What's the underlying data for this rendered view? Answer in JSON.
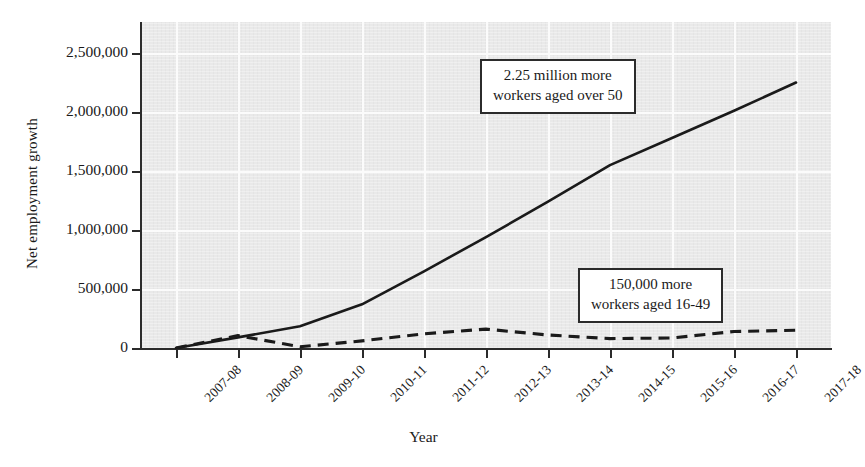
{
  "chart_data": {
    "type": "line",
    "title": "",
    "xlabel": "Year",
    "ylabel": "Net employment growth",
    "categories": [
      "2007-08",
      "2008-09",
      "2009-10",
      "2010-11",
      "2011-12",
      "2012-13",
      "2013-14",
      "2014-15",
      "2015-16",
      "2016-17",
      "2017-18"
    ],
    "ylim": [
      0,
      2500000
    ],
    "yticks": [
      0,
      500000,
      1000000,
      1500000,
      2000000,
      2500000
    ],
    "ytick_labels": [
      "0",
      "500,000",
      "1,000,000",
      "1,500,000",
      "2,000,000",
      "2,500,000"
    ],
    "grid": true,
    "legend_position": "none",
    "series": [
      {
        "name": "workers aged over 50",
        "style": "solid",
        "color": "#1a1a1a",
        "values": [
          0,
          90000,
          185000,
          370000,
          650000,
          940000,
          1240000,
          1550000,
          1780000,
          2010000,
          2250000
        ]
      },
      {
        "name": "workers aged 16-49",
        "style": "dashed",
        "color": "#1a1a1a",
        "values": [
          0,
          105000,
          10000,
          60000,
          120000,
          160000,
          110000,
          80000,
          85000,
          140000,
          150000
        ]
      }
    ],
    "annotations": [
      {
        "id": "over50",
        "line1": "2.25 million more",
        "line2": "workers aged over 50"
      },
      {
        "id": "aged1649",
        "line1": "150,000 more",
        "line2": "workers aged 16-49"
      }
    ]
  },
  "axes": {
    "y_title": "Net employment growth",
    "x_title": "Year"
  },
  "colors": {
    "plot_background": "#e9e9e9",
    "gridline": "#fbfbfb",
    "axis": "#2b2b2b",
    "series": "#1a1a1a",
    "page_background": "#ffffff"
  }
}
